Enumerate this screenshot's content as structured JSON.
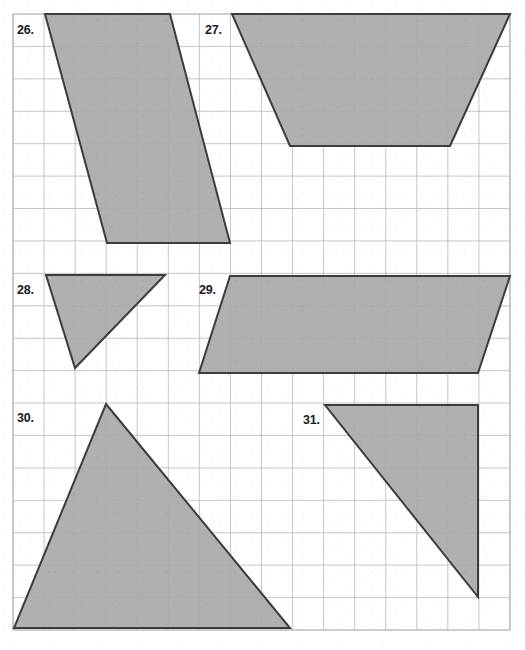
{
  "page": {
    "type": "geometry-worksheet",
    "width": 525,
    "height": 650,
    "background_color": "#ffffff"
  },
  "grid": {
    "left": 13,
    "top": 14,
    "right": 510,
    "bottom": 630,
    "columns": 16,
    "rows": 19,
    "cell_width": 31.06,
    "cell_height": 32.42,
    "line_color": "#b9bcc4",
    "border_color": "#9a9da6"
  },
  "style": {
    "shape_fill": "#a9a9a9",
    "shape_stroke": "#3c3c3c",
    "shape_stroke_width": 2,
    "label_color": "#1a1a1a"
  },
  "problems": [
    {
      "number": "26.",
      "shape": "parallelogram",
      "label_x": 17,
      "label_y": 23,
      "points": "45,14 170,14 230,243 107,243"
    },
    {
      "number": "27.",
      "shape": "trapezoid",
      "label_x": 205,
      "label_y": 23,
      "points": "232,14 510,14 450,146 290,146"
    },
    {
      "number": "28.",
      "shape": "triangle",
      "label_x": 17,
      "label_y": 283,
      "points": "46,275 165,275 75,368"
    },
    {
      "number": "29.",
      "shape": "parallelogram",
      "label_x": 199,
      "label_y": 283,
      "points": "230,276 510,276 478,373 199,373"
    },
    {
      "number": "30.",
      "shape": "triangle",
      "label_x": 17,
      "label_y": 411,
      "points": "106,404 290,628 14,628"
    },
    {
      "number": "31.",
      "shape": "right-triangle",
      "label_x": 303,
      "label_y": 413,
      "points": "325,405 478,405 478,597"
    }
  ]
}
